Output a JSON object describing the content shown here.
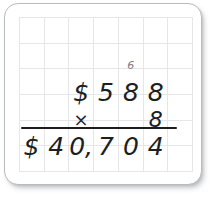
{
  "worksheet": {
    "kind": "long-multiplication",
    "grid": {
      "columns": 7,
      "rows": 6,
      "line_color": "#e4e6e7"
    },
    "card": {
      "background": "#ffffff",
      "border_color": "#b8bcbe"
    },
    "ink_color": "#201f1f",
    "carry_ink_color": "#7e8184",
    "rule_color": "#1d1d1d",
    "carry_row": {
      "label": "carry digits",
      "cells": [
        "",
        "",
        "",
        "",
        "6",
        "",
        ""
      ]
    },
    "multiplicand_row": {
      "label": "multiplicand",
      "cells": [
        "",
        "",
        "$",
        "5",
        "8",
        "8",
        ""
      ]
    },
    "multiplier_row": {
      "label": "multiplier",
      "cells": [
        "",
        "",
        "×",
        "",
        "",
        "8",
        ""
      ]
    },
    "product_row": {
      "label": "product",
      "cells": [
        "$",
        "4",
        "0,",
        "7",
        "0",
        "4",
        ""
      ]
    },
    "problem": {
      "multiplicand": "$588",
      "multiplier": "8",
      "product": "$40,704",
      "carry": "6"
    }
  }
}
